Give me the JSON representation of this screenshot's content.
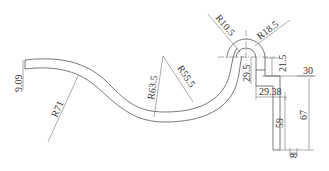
{
  "drawing": {
    "type": "technical-drawing",
    "subject": "bent tube / S-curve profile with U-bend",
    "line_color": "#555555",
    "text_color": "#333333",
    "dimensions": {
      "thickness": "9.09",
      "r71": "R71",
      "r63_5": "R63.5",
      "r55_5": "R55.5",
      "r10_5": "R10.5",
      "r18_5": "R18.5",
      "d29_5": "29.5",
      "d21_5": "21.5",
      "d30": "30",
      "d29_38": "29.38",
      "d59": "59",
      "d67": "67",
      "d8": "8"
    }
  }
}
